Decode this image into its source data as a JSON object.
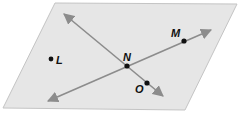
{
  "diagram": {
    "type": "geometry-plane",
    "colors": {
      "plane_fill": "#e6e6e6",
      "plane_stroke": "#c4c4c4",
      "line": "#8c8c8c",
      "point": "#111111",
      "label": "#111111"
    },
    "plane": {
      "vertices": [
        [
          55,
          3
        ],
        [
          237,
          4
        ],
        [
          185,
          110
        ],
        [
          3,
          108
        ]
      ]
    },
    "lines": [
      {
        "name": "line-through-N-O",
        "from": [
          64,
          14
        ],
        "to": [
          163,
          96
        ],
        "arrows": "both"
      },
      {
        "name": "line-through-N-M",
        "from": [
          48,
          101
        ],
        "to": [
          211,
          30
        ],
        "arrows": "both"
      }
    ],
    "points": [
      {
        "label": "L",
        "x": 51,
        "y": 59,
        "label_x": 56,
        "label_y": 64
      },
      {
        "label": "N",
        "x": 127,
        "y": 66,
        "label_x": 123,
        "label_y": 61
      },
      {
        "label": "M",
        "x": 184,
        "y": 41,
        "label_x": 171,
        "label_y": 37
      },
      {
        "label": "O",
        "x": 147,
        "y": 83,
        "label_x": 135,
        "label_y": 93
      }
    ]
  }
}
